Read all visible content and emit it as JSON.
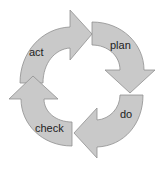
{
  "diagram": {
    "type": "cycle",
    "colors": {
      "fill": "#c9c9c9",
      "stroke": "#8f8f8f",
      "text": "#222222",
      "background": "#ffffff"
    },
    "stages": [
      {
        "id": "act",
        "label": "act"
      },
      {
        "id": "plan",
        "label": "plan"
      },
      {
        "id": "do",
        "label": "do"
      },
      {
        "id": "check",
        "label": "check"
      }
    ],
    "flow": [
      "act",
      "plan",
      "do",
      "check",
      "act"
    ]
  }
}
